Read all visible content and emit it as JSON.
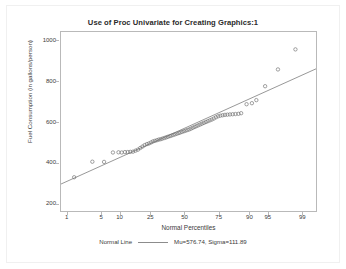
{
  "chart": {
    "title": "Use of Proc Univariate for Creating Graphics:1",
    "legend": {
      "series_label": "Normal Line",
      "stats_label": "Mu=576.74, Sigma=111.89"
    }
  },
  "chart_data": {
    "type": "scatter",
    "title": "Use of Proc Univariate for Creating Graphics:1",
    "xlabel": "Normal Percentiles",
    "ylabel": "Fuel Consumption (in gallons/person)",
    "x_scale": "probit",
    "xticks": [
      1,
      5,
      10,
      25,
      50,
      75,
      90,
      95,
      99
    ],
    "xtick_labels": [
      "1",
      "5",
      "10",
      "25",
      "50",
      "75",
      "90",
      "95",
      "99"
    ],
    "yticks": [
      200,
      400,
      600,
      800,
      1000
    ],
    "ytick_labels": [
      "200",
      "400",
      "600",
      "800",
      "1000"
    ],
    "ylim": [
      170,
      1045
    ],
    "xlim": [
      0.7,
      99.5
    ],
    "grid": false,
    "legend_position": "bottom-center",
    "marker": "open-circle",
    "marker_color": "#6e6e6e",
    "line_color": "#8c8c8c",
    "fit": {
      "name": "Normal Line",
      "mu": 576.74,
      "sigma": 111.89
    },
    "series": [
      {
        "name": "Fuel Consumption",
        "x": [
          1.4,
          3.3,
          5.4,
          7.6,
          9.3,
          10.4,
          11.6,
          12.7,
          13.8,
          15.0,
          16.2,
          17.4,
          18.6,
          19.8,
          21.0,
          22.3,
          23.5,
          24.8,
          26.0,
          27.3,
          28.6,
          29.9,
          31.2,
          32.5,
          33.9,
          35.2,
          36.5,
          37.9,
          39.2,
          40.6,
          41.9,
          43.3,
          44.7,
          46.0,
          47.4,
          48.8,
          50.2,
          51.6,
          53.0,
          54.4,
          55.8,
          57.2,
          58.6,
          60.0,
          61.4,
          62.8,
          64.2,
          65.6,
          67.0,
          68.4,
          69.8,
          71.2,
          72.6,
          74.0,
          75.4,
          76.8,
          78.2,
          79.6,
          81.0,
          82.4,
          83.8,
          85.2,
          86.4,
          88.6,
          90.5,
          91.9,
          94.2,
          96.6,
          98.5
        ],
        "y": [
          335,
          411,
          410,
          456,
          457,
          456,
          458,
          458,
          459,
          460,
          465,
          470,
          478,
          485,
          492,
          497,
          500,
          505,
          510,
          513,
          516,
          519,
          521,
          524,
          527,
          530,
          533,
          536,
          539,
          542,
          545,
          548,
          551,
          554,
          557,
          560,
          563,
          566,
          569,
          573,
          577,
          581,
          585,
          589,
          593,
          597,
          601,
          605,
          609,
          613,
          617,
          622,
          628,
          633,
          636,
          638,
          640,
          641,
          642,
          643,
          644,
          645,
          648,
          692,
          697,
          712,
          780,
          862,
          960
        ]
      }
    ]
  }
}
